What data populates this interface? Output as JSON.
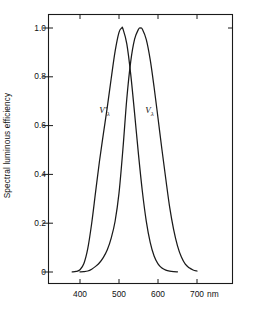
{
  "chart_data": {
    "type": "line",
    "title": "",
    "subtitle": "",
    "xlabel": "",
    "ylabel": "Spectral luminous efficiency",
    "x_unit": "nm",
    "xlim": [
      360,
      715
    ],
    "ylim": [
      0,
      1.08
    ],
    "grid": false,
    "legend_position": "inline-annotation",
    "x_ticks": [
      400,
      500,
      600,
      700
    ],
    "x_tick_labels": [
      "400",
      "500",
      "600",
      "700"
    ],
    "y_ticks": [
      0,
      0.2,
      0.4,
      0.6,
      0.8,
      1.0
    ],
    "y_tick_labels": [
      "0",
      "0.2",
      "0.4",
      "0.6",
      "0.8",
      "1.0"
    ],
    "annotations": [
      {
        "text": "V'",
        "sub": "λ",
        "x": 470,
        "y": 0.66
      },
      {
        "text": "V",
        "sub": "λ",
        "x": 588,
        "y": 0.66
      }
    ],
    "series": [
      {
        "name": "V'λ",
        "label": "V'",
        "subscript": "λ",
        "description": "Scotopic spectral luminous efficiency",
        "peak_x": 507,
        "peak_y": 1.0,
        "color": "#1a1a1a",
        "x": [
          380,
          390,
          400,
          410,
          420,
          430,
          440,
          450,
          460,
          470,
          480,
          490,
          500,
          507,
          510,
          520,
          530,
          540,
          550,
          560,
          570,
          580,
          590,
          600,
          610,
          620,
          630,
          640,
          650
        ],
        "values": [
          0.000589,
          0.00221,
          0.00929,
          0.0348,
          0.0966,
          0.1998,
          0.3281,
          0.455,
          0.567,
          0.676,
          0.793,
          0.904,
          0.982,
          1.0,
          0.997,
          0.935,
          0.811,
          0.65,
          0.481,
          0.3288,
          0.2076,
          0.1212,
          0.0655,
          0.03315,
          0.01593,
          0.00737,
          0.003335,
          0.001497,
          0.000677
        ]
      },
      {
        "name": "Vλ",
        "label": "V",
        "subscript": "λ",
        "description": "Photopic spectral luminous efficiency",
        "peak_x": 555,
        "peak_y": 1.0,
        "color": "#1a1a1a",
        "x": [
          400,
          410,
          420,
          430,
          440,
          450,
          460,
          470,
          480,
          490,
          500,
          510,
          520,
          530,
          540,
          550,
          555,
          560,
          570,
          580,
          590,
          600,
          610,
          620,
          630,
          640,
          650,
          660,
          670,
          680,
          690,
          700
        ],
        "values": [
          0.0004,
          0.0012,
          0.004,
          0.0116,
          0.023,
          0.038,
          0.06,
          0.091,
          0.139,
          0.208,
          0.323,
          0.503,
          0.71,
          0.862,
          0.954,
          0.995,
          1.0,
          0.995,
          0.952,
          0.87,
          0.757,
          0.631,
          0.503,
          0.381,
          0.265,
          0.175,
          0.107,
          0.061,
          0.032,
          0.017,
          0.0082,
          0.0041
        ]
      }
    ]
  },
  "axes": {
    "frame_color": "#1a1a1a",
    "tick_side_top": true,
    "tick_side_right": true,
    "x_unit_label": "nm"
  }
}
